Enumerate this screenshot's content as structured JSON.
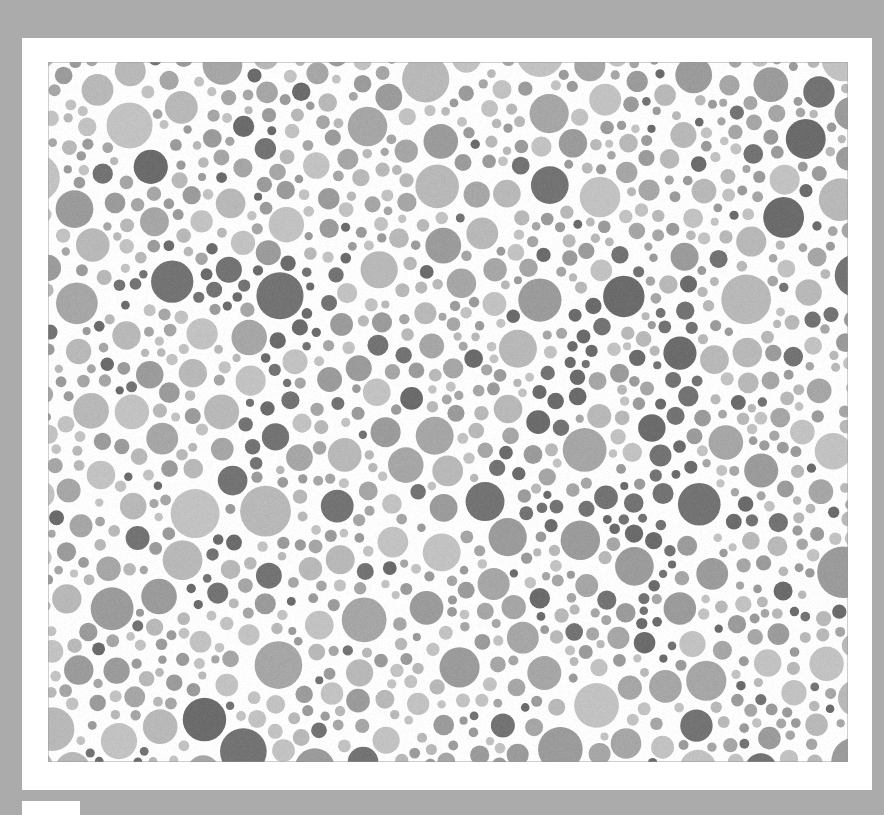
{
  "plate": {
    "title": "Ishihara colour vision test plate",
    "kind": "pseudoisochromatic-plate",
    "rendering": "grayscale",
    "hidden_figure": "74",
    "background_color": "#ababab",
    "mat_color": "#ffffff",
    "plate_background_color": "#fdfdfd",
    "caption_tab_color": "#ffffff",
    "dot_palette": {
      "light": "#b8b8b8",
      "light_alt": "#c2c2c2",
      "medium": "#9b9b9b",
      "medium_alt": "#a6a6a6",
      "figure_dark": "#737373",
      "figure_dark_alt": "#6b6b6b"
    },
    "geometry": {
      "stage_width": 884,
      "stage_height": 815,
      "mat_left": 22,
      "mat_top": 38,
      "mat_width": 850,
      "mat_height": 752,
      "field_left": 48,
      "field_top": 62,
      "field_width": 800,
      "field_height": 700,
      "dot_radius_min": 4,
      "dot_radius_max": 26,
      "dot_gap": 2,
      "dot_count_target": 1500,
      "seed": 20240917
    },
    "figure_strokes": [
      {
        "glyph": "7",
        "type": "bar",
        "x1": 0.085,
        "y1": 0.33,
        "x2": 0.36,
        "y2": 0.3,
        "width": 0.052
      },
      {
        "glyph": "7",
        "type": "diag",
        "x1": 0.34,
        "y1": 0.305,
        "x2": 0.185,
        "y2": 0.76,
        "width": 0.055
      },
      {
        "glyph": "4",
        "type": "diag",
        "x1": 0.72,
        "y1": 0.3,
        "x2": 0.56,
        "y2": 0.64,
        "width": 0.05
      },
      {
        "glyph": "4",
        "type": "bar",
        "x1": 0.545,
        "y1": 0.64,
        "x2": 0.89,
        "y2": 0.66,
        "width": 0.05
      },
      {
        "glyph": "4",
        "type": "stem",
        "x1": 0.79,
        "y1": 0.3,
        "x2": 0.76,
        "y2": 0.84,
        "width": 0.05
      }
    ]
  }
}
